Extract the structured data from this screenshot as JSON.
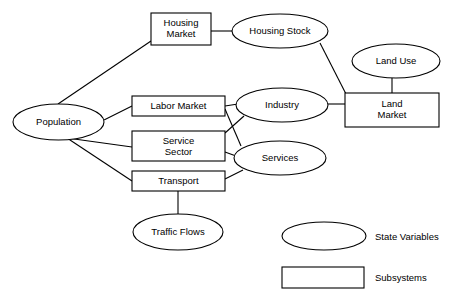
{
  "diagram": {
    "style": {
      "background": "#ffffff",
      "stroke": "#000000",
      "fill": "#ffffff",
      "text": "#000000"
    },
    "nodes": [
      {
        "id": "population",
        "label": "Population",
        "kind": "state-variable",
        "shape": "ellipse",
        "cx": 58.5,
        "cy": 122,
        "rx": 45.5,
        "ry": 18,
        "lines": [
          "Population"
        ]
      },
      {
        "id": "housing-market",
        "label": "Housing Market",
        "kind": "subsystem",
        "shape": "rect",
        "x": 151,
        "y": 13,
        "w": 60,
        "h": 32,
        "lines": [
          "Housing",
          "Market"
        ]
      },
      {
        "id": "housing-stock",
        "label": "Housing Stock",
        "kind": "state-variable",
        "shape": "ellipse",
        "cx": 280,
        "cy": 31,
        "rx": 48,
        "ry": 17,
        "lines": [
          "Housing Stock"
        ]
      },
      {
        "id": "land-use",
        "label": "Land Use",
        "kind": "state-variable",
        "shape": "ellipse",
        "cx": 396,
        "cy": 61,
        "rx": 44,
        "ry": 17,
        "lines": [
          "Land Use"
        ]
      },
      {
        "id": "land-market",
        "label": "Land Market",
        "kind": "subsystem",
        "shape": "rect",
        "x": 345,
        "y": 93,
        "w": 94,
        "h": 34,
        "lines": [
          "Land",
          "Market"
        ]
      },
      {
        "id": "labor-market",
        "label": "Labor Market",
        "kind": "subsystem",
        "shape": "rect",
        "x": 132,
        "y": 96,
        "w": 93,
        "h": 20,
        "lines": [
          "Labor Market"
        ]
      },
      {
        "id": "industry",
        "label": "Industry",
        "kind": "state-variable",
        "shape": "ellipse",
        "cx": 282,
        "cy": 105,
        "rx": 46,
        "ry": 17,
        "lines": [
          "Industry"
        ]
      },
      {
        "id": "service-sector",
        "label": "Service Sector",
        "kind": "subsystem",
        "shape": "rect",
        "x": 132,
        "y": 131,
        "w": 93,
        "h": 30,
        "lines": [
          "Service",
          "Sector"
        ]
      },
      {
        "id": "services",
        "label": "Services",
        "kind": "state-variable",
        "shape": "ellipse",
        "cx": 280,
        "cy": 158,
        "rx": 46,
        "ry": 17,
        "lines": [
          "Services"
        ]
      },
      {
        "id": "transport",
        "label": "Transport",
        "kind": "subsystem",
        "shape": "rect",
        "x": 132,
        "y": 171,
        "w": 93,
        "h": 20,
        "lines": [
          "Transport"
        ]
      },
      {
        "id": "traffic-flows",
        "label": "Traffic Flows",
        "kind": "state-variable",
        "shape": "ellipse",
        "cx": 178,
        "cy": 232,
        "rx": 45,
        "ry": 18,
        "lines": [
          "Traffic Flows"
        ]
      }
    ],
    "edges": [
      {
        "id": "population-housing-market",
        "from": "population",
        "to": "housing-market",
        "path": "M 58,104 L 151,41"
      },
      {
        "id": "population-labor-market",
        "from": "population",
        "to": "labor-market",
        "path": "M 104,120 L 132,106"
      },
      {
        "id": "population-service-sector",
        "from": "population",
        "to": "service-sector",
        "path": "M 67,138 L 132,147"
      },
      {
        "id": "population-transport",
        "from": "population",
        "to": "transport",
        "path": "M 67,138 L 132,181"
      },
      {
        "id": "housing-market-housing-stock",
        "from": "housing-market",
        "to": "housing-stock",
        "path": "M 211,31 L 233,31"
      },
      {
        "id": "housing-stock-land-market",
        "from": "housing-stock",
        "to": "land-market",
        "path": "M 320,43 L 346,94"
      },
      {
        "id": "land-use-land-market",
        "from": "land-use",
        "to": "land-market",
        "path": "M 392,78 L 392,93"
      },
      {
        "id": "labor-market-industry",
        "from": "labor-market",
        "to": "industry",
        "path": "M 225,106 L 238,104"
      },
      {
        "id": "labor-market-services",
        "from": "labor-market",
        "to": "services",
        "path": "M 225,109 L 241,146"
      },
      {
        "id": "service-sector-industry",
        "from": "service-sector",
        "to": "industry",
        "path": "M 225,133 L 244,116"
      },
      {
        "id": "service-sector-services",
        "from": "service-sector",
        "to": "services",
        "path": "M 225,152 L 236,156"
      },
      {
        "id": "transport-services",
        "from": "transport",
        "to": "services",
        "path": "M 225,179 L 243,170"
      },
      {
        "id": "industry-land-market",
        "from": "industry",
        "to": "land-market",
        "path": "M 328,104 L 345,104"
      },
      {
        "id": "transport-traffic-flows",
        "from": "transport",
        "to": "traffic-flows",
        "path": "M 178,191 L 178,214"
      }
    ]
  },
  "legend": {
    "items": [
      {
        "id": "legend-state-variables",
        "label": "State Variables",
        "shape": "ellipse",
        "cx": 324,
        "cy": 236,
        "rx": 42,
        "ry": 14,
        "label_x": 375,
        "label_y": 231
      },
      {
        "id": "legend-subsystems",
        "label": "Subsystems",
        "shape": "rect",
        "x": 282,
        "y": 267,
        "w": 82,
        "h": 21,
        "label_x": 375,
        "label_y": 272
      }
    ]
  }
}
